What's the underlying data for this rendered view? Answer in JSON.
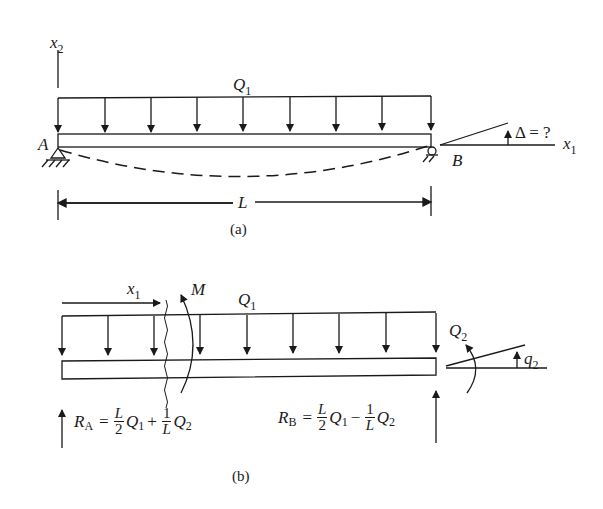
{
  "figure_a": {
    "axis_vertical": {
      "name": "x",
      "sub": "2"
    },
    "load_label": {
      "name": "Q",
      "sub": "1"
    },
    "support_left": "A",
    "support_right": "B",
    "rotation_label": "Δ = ?",
    "axis_horizontal": {
      "name": "x",
      "sub": "1"
    },
    "span_label": "L",
    "caption": "(a)"
  },
  "figure_b": {
    "section_coord": {
      "name": "x",
      "sub": "1"
    },
    "moment_label": "M",
    "load_label": {
      "name": "Q",
      "sub": "1"
    },
    "end_moment_label": {
      "name": "Q",
      "sub": "2"
    },
    "end_rotation_label": {
      "name": "q",
      "sub": "2"
    },
    "reaction_a": {
      "lhs_name": "R",
      "lhs_sub": "A",
      "equals": "=",
      "t1_num": "L",
      "t1_den": "2",
      "t1_var": "Q",
      "t1_sub": "1",
      "op": "+",
      "t2_num": "1",
      "t2_den": "L",
      "t2_var": "Q",
      "t2_sub": "2"
    },
    "reaction_b": {
      "lhs_name": "R",
      "lhs_sub": "B",
      "equals": "=",
      "t1_num": "L",
      "t1_den": "2",
      "t1_var": "Q",
      "t1_sub": "1",
      "op": "−",
      "t2_num": "1",
      "t2_den": "L",
      "t2_var": "Q",
      "t2_sub": "2"
    },
    "caption": "(b)"
  }
}
